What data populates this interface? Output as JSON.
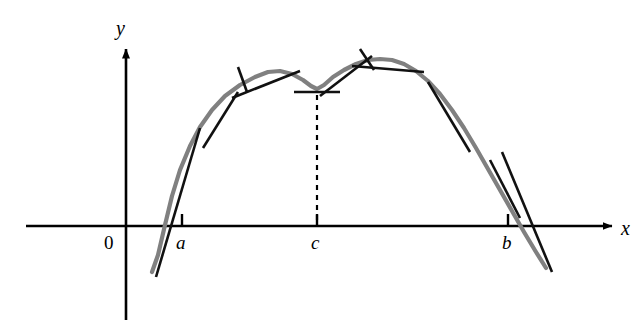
{
  "figure": {
    "title": "",
    "background_color": "#ffffff",
    "width": 637,
    "height": 325
  },
  "axes": {
    "x_axis_label": "x",
    "y_axis_label": "y",
    "origin_label": "0",
    "x_axis_y_pixel": 226,
    "y_axis_x_pixel": 126,
    "x_axis_color": "#000000",
    "y_axis_color": "#000000"
  },
  "ticks": [
    {
      "label": "a",
      "x_pixel": 182
    },
    {
      "label": "c",
      "x_pixel": 317
    },
    {
      "label": "b",
      "x_pixel": 508
    }
  ],
  "curve": {
    "name": "function-curve",
    "color": "#808080",
    "stroke_width": 4.2,
    "description": "smooth curve rising steeply past a, first local maximum, dip to local minimum at c, second local maximum, then falling steeply past b",
    "points": [
      [
        152,
        272
      ],
      [
        158,
        255
      ],
      [
        165,
        225
      ],
      [
        172,
        196
      ],
      [
        180,
        170
      ],
      [
        190,
        146
      ],
      [
        200,
        127
      ],
      [
        212,
        110
      ],
      [
        225,
        96
      ],
      [
        240,
        85
      ],
      [
        255,
        77
      ],
      [
        268,
        72
      ],
      [
        280,
        71
      ],
      [
        292,
        74
      ],
      [
        303,
        80
      ],
      [
        311,
        86
      ],
      [
        317,
        89
      ],
      [
        324,
        85
      ],
      [
        333,
        77
      ],
      [
        344,
        70
      ],
      [
        356,
        64
      ],
      [
        368,
        60
      ],
      [
        380,
        59
      ],
      [
        392,
        60
      ],
      [
        404,
        64
      ],
      [
        416,
        71
      ],
      [
        428,
        81
      ],
      [
        440,
        94
      ],
      [
        452,
        110
      ],
      [
        464,
        128
      ],
      [
        476,
        148
      ],
      [
        488,
        169
      ],
      [
        500,
        190
      ],
      [
        512,
        211
      ],
      [
        524,
        232
      ],
      [
        536,
        252
      ],
      [
        546,
        268
      ]
    ]
  },
  "tangent_lines": [
    {
      "name": "tangent-at-a",
      "note": "steep positive slope where curve crosses near a",
      "x1": 156,
      "y1": 277,
      "x2": 200,
      "y2": 128
    },
    {
      "name": "tangent-left-rise",
      "note": "tangent on rising branch between a and first peak",
      "x1": 203,
      "y1": 148,
      "x2": 238,
      "y2": 92
    },
    {
      "name": "tangent-first-peak",
      "note": "near-horizontal tangent at first local maximum",
      "x1": 232,
      "y1": 98,
      "x2": 300,
      "y2": 71
    },
    {
      "name": "tangent-first-peak-crossbar",
      "note": "short crossing stroke marking the first peak tangency point",
      "x1": 238,
      "y1": 67,
      "x2": 247,
      "y2": 92
    },
    {
      "name": "tangent-at-c",
      "note": "horizontal tangent at the local minimum c",
      "x1": 294,
      "y1": 92,
      "x2": 340,
      "y2": 92
    },
    {
      "name": "tangent-right-rise",
      "note": "tangent on rising branch between c and second peak",
      "x1": 320,
      "y1": 96,
      "x2": 372,
      "y2": 56
    },
    {
      "name": "tangent-second-peak",
      "note": "near-horizontal tangent at second local maximum",
      "x1": 352,
      "y1": 66,
      "x2": 424,
      "y2": 72
    },
    {
      "name": "tangent-second-peak-crossbar",
      "note": "short crossing stroke marking the second peak tangency point",
      "x1": 360,
      "y1": 49,
      "x2": 374,
      "y2": 70
    },
    {
      "name": "tangent-right-fall-upper",
      "note": "tangent on descending branch, upper segment",
      "x1": 428,
      "y1": 82,
      "x2": 470,
      "y2": 152
    },
    {
      "name": "tangent-right-fall-lower",
      "note": "tangent on descending branch, lower segment",
      "x1": 490,
      "y1": 160,
      "x2": 520,
      "y2": 218
    },
    {
      "name": "tangent-at-b",
      "note": "steep negative slope where curve crosses near b",
      "x1": 502,
      "y1": 152,
      "x2": 552,
      "y2": 272
    }
  ],
  "dashed_line": {
    "name": "vertical-dashed-line-at-c",
    "x_pixel": 317,
    "y_top": 95,
    "y_bottom": 226,
    "color": "#000000",
    "dash_pattern": "5,5"
  }
}
